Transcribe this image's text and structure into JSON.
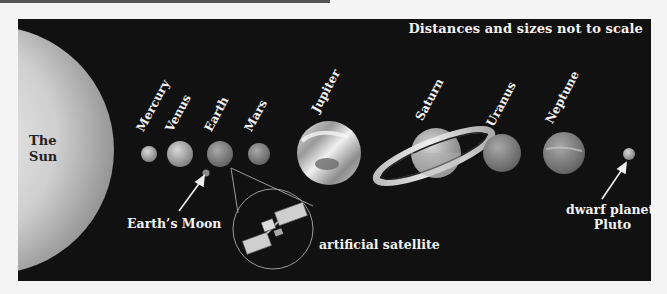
{
  "diagram": {
    "title_note": "Distances and sizes not to scale",
    "sun": {
      "label_line1": "The",
      "label_line2": "Sun",
      "color": "#d9d9d9"
    },
    "planets": [
      {
        "name": "Mercury"
      },
      {
        "name": "Venus"
      },
      {
        "name": "Earth"
      },
      {
        "name": "Mars"
      },
      {
        "name": "Jupiter"
      },
      {
        "name": "Saturn"
      },
      {
        "name": "Uranus"
      },
      {
        "name": "Neptune"
      }
    ],
    "callouts": {
      "moon": "Earth’s Moon",
      "satellite": "artificial satellite",
      "pluto_line1": "dwarf planet:",
      "pluto_line2": "Pluto"
    },
    "colors": {
      "panel_background": "#111111",
      "page_background": "#f4f4f4",
      "label_text": "#f2f2f2"
    }
  }
}
